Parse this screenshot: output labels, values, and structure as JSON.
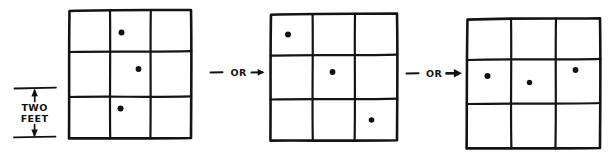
{
  "diagram": {
    "style": "hand-drawn",
    "background_color": "#ffffff",
    "ink_color": "#141414",
    "dimension": {
      "label_line1": "TWO",
      "label_line2": "FEET",
      "measures": "grid cell height",
      "arrow_style": "double-headed vertical dimension line"
    },
    "connectors": [
      {
        "label": "OR"
      },
      {
        "label": "OR"
      }
    ],
    "grids": [
      {
        "name": "grid-1",
        "rows": 3,
        "cols": 3,
        "dot_count": 3,
        "arrangement": "vertical-middle-column",
        "dots": [
          {
            "row": 1,
            "col": 2,
            "cell": "top-middle"
          },
          {
            "row": 2,
            "col": 2,
            "cell": "center"
          },
          {
            "row": 3,
            "col": 2,
            "cell": "bottom-middle"
          }
        ]
      },
      {
        "name": "grid-2",
        "rows": 3,
        "cols": 3,
        "dot_count": 3,
        "arrangement": "diagonal",
        "dots": [
          {
            "row": 1,
            "col": 1,
            "cell": "top-left"
          },
          {
            "row": 2,
            "col": 2,
            "cell": "center"
          },
          {
            "row": 3,
            "col": 3,
            "cell": "bottom-right"
          }
        ]
      },
      {
        "name": "grid-3",
        "rows": 3,
        "cols": 3,
        "dot_count": 3,
        "arrangement": "horizontal-middle-row",
        "dots": [
          {
            "row": 2,
            "col": 1,
            "cell": "middle-left"
          },
          {
            "row": 2,
            "col": 2,
            "cell": "center"
          },
          {
            "row": 2,
            "col": 3,
            "cell": "middle-right"
          }
        ]
      }
    ]
  }
}
